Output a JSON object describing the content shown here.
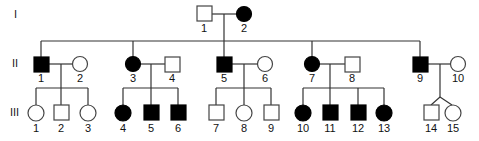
{
  "diagram": {
    "type": "pedigree",
    "generations": [
      "I",
      "II",
      "III"
    ],
    "individuals": [
      {
        "id": "I-1",
        "gen": "I",
        "label": "1",
        "sex": "male",
        "affected": false
      },
      {
        "id": "I-2",
        "gen": "I",
        "label": "2",
        "sex": "female",
        "affected": true
      },
      {
        "id": "II-1",
        "gen": "II",
        "label": "1",
        "sex": "male",
        "affected": true
      },
      {
        "id": "II-2",
        "gen": "II",
        "label": "2",
        "sex": "female",
        "affected": false
      },
      {
        "id": "II-3",
        "gen": "II",
        "label": "3",
        "sex": "female",
        "affected": true
      },
      {
        "id": "II-4",
        "gen": "II",
        "label": "4",
        "sex": "male",
        "affected": false
      },
      {
        "id": "II-5",
        "gen": "II",
        "label": "5",
        "sex": "male",
        "affected": true
      },
      {
        "id": "II-6",
        "gen": "II",
        "label": "6",
        "sex": "female",
        "affected": false
      },
      {
        "id": "II-7",
        "gen": "II",
        "label": "7",
        "sex": "female",
        "affected": true
      },
      {
        "id": "II-8",
        "gen": "II",
        "label": "8",
        "sex": "male",
        "affected": false
      },
      {
        "id": "II-9",
        "gen": "II",
        "label": "9",
        "sex": "male",
        "affected": true
      },
      {
        "id": "II-10",
        "gen": "II",
        "label": "10",
        "sex": "female",
        "affected": false
      },
      {
        "id": "III-1",
        "gen": "III",
        "label": "1",
        "sex": "female",
        "affected": false
      },
      {
        "id": "III-2",
        "gen": "III",
        "label": "2",
        "sex": "male",
        "affected": false
      },
      {
        "id": "III-3",
        "gen": "III",
        "label": "3",
        "sex": "female",
        "affected": false
      },
      {
        "id": "III-4",
        "gen": "III",
        "label": "4",
        "sex": "female",
        "affected": true
      },
      {
        "id": "III-5",
        "gen": "III",
        "label": "5",
        "sex": "male",
        "affected": true
      },
      {
        "id": "III-6",
        "gen": "III",
        "label": "6",
        "sex": "male",
        "affected": true
      },
      {
        "id": "III-7",
        "gen": "III",
        "label": "7",
        "sex": "male",
        "affected": false
      },
      {
        "id": "III-8",
        "gen": "III",
        "label": "8",
        "sex": "female",
        "affected": false
      },
      {
        "id": "III-9",
        "gen": "III",
        "label": "9",
        "sex": "male",
        "affected": false
      },
      {
        "id": "III-10",
        "gen": "III",
        "label": "10",
        "sex": "female",
        "affected": true
      },
      {
        "id": "III-11",
        "gen": "III",
        "label": "11",
        "sex": "male",
        "affected": true
      },
      {
        "id": "III-12",
        "gen": "III",
        "label": "12",
        "sex": "male",
        "affected": true
      },
      {
        "id": "III-13",
        "gen": "III",
        "label": "13",
        "sex": "female",
        "affected": true
      },
      {
        "id": "III-14",
        "gen": "III",
        "label": "14",
        "sex": "male",
        "affected": false,
        "twin": true
      },
      {
        "id": "III-15",
        "gen": "III",
        "label": "15",
        "sex": "female",
        "affected": false,
        "twin": true
      }
    ],
    "couples": [
      [
        "I-1",
        "I-2"
      ],
      [
        "II-1",
        "II-2"
      ],
      [
        "II-3",
        "II-4"
      ],
      [
        "II-5",
        "II-6"
      ],
      [
        "II-7",
        "II-8"
      ],
      [
        "II-9",
        "II-10"
      ]
    ],
    "colors": {
      "affected": "#000000",
      "unaffected": "#ffffff",
      "line": "#333333"
    }
  }
}
